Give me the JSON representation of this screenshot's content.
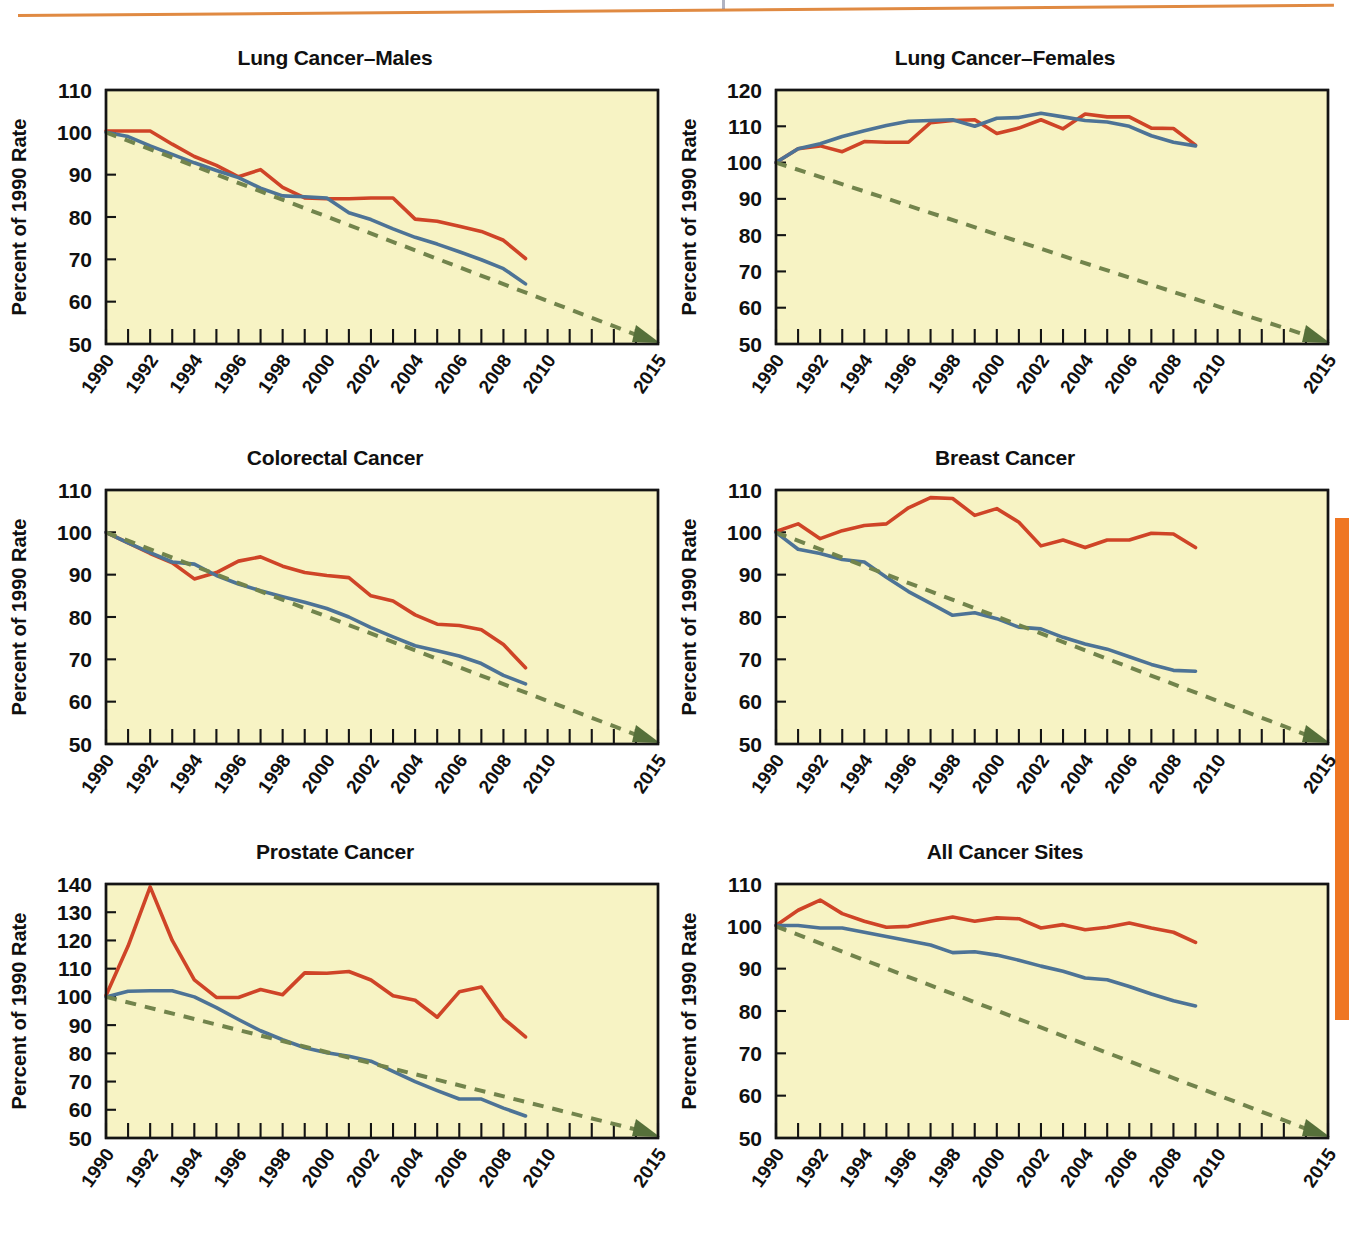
{
  "page": {
    "accent_orange": "#ef7622",
    "rule_color": "#e08a42",
    "plot_background": "#f7f3c4",
    "series_colors": {
      "observed_red": "#cf4427",
      "observed_blue": "#4d7396",
      "target_green": "#72844c"
    }
  },
  "axis_common": {
    "xlabel": "Year",
    "ylabel": "Percent of 1990 Rate",
    "xtick_labels": [
      "1990",
      "1992",
      "1994",
      "1996",
      "1998",
      "2000",
      "2002",
      "2004",
      "2006",
      "2008",
      "2010",
      "2015"
    ],
    "xtick_values": [
      1990,
      1992,
      1994,
      1996,
      1998,
      2000,
      2002,
      2004,
      2006,
      2008,
      2010,
      2015
    ],
    "xlim": [
      1990,
      2015
    ],
    "minor_tick_step": 1
  },
  "chart_data": [
    {
      "type": "line",
      "title": "Lung Cancer–Males",
      "xlabel": "Year",
      "ylabel": "Percent of 1990 Rate",
      "ylim": [
        50,
        110
      ],
      "ytick_labels": [
        "50",
        "60",
        "70",
        "80",
        "90",
        "100",
        "110"
      ],
      "ytick_values": [
        50,
        60,
        70,
        80,
        90,
        100,
        110
      ],
      "grid": false,
      "legend": "none",
      "x": [
        1990,
        1991,
        1992,
        1993,
        1994,
        1995,
        1996,
        1997,
        1998,
        1999,
        2000,
        2001,
        2002,
        2003,
        2004,
        2005,
        2006,
        2007,
        2008,
        2009
      ],
      "series": [
        {
          "name": "Observed (red)",
          "color": "#cf4427",
          "values": [
            100.3,
            100.3,
            100.3,
            97.2,
            94.3,
            92.2,
            89.5,
            91.2,
            87.0,
            84.5,
            84.3,
            84.3,
            84.5,
            84.5,
            79.5,
            79.0,
            77.8,
            76.6,
            74.5,
            70.2
          ]
        },
        {
          "name": "Observed (blue)",
          "color": "#4d7396",
          "values": [
            100.0,
            99.0,
            96.8,
            94.8,
            92.8,
            91.0,
            89.3,
            86.8,
            85.0,
            84.8,
            84.5,
            81.0,
            79.4,
            77.2,
            75.2,
            73.6,
            71.8,
            69.9,
            67.8,
            64.2
          ]
        },
        {
          "name": "Healthy People 2020 target (green dashed)",
          "color": "#72844c",
          "dashed": true,
          "values": [
            100.0,
            50.0
          ],
          "endpoints_x": [
            1990,
            2015
          ],
          "arrow_end": true
        }
      ]
    },
    {
      "type": "line",
      "title": "Lung Cancer–Females",
      "xlabel": "Year",
      "ylabel": "Percent of 1990 Rate",
      "ylim": [
        50,
        120
      ],
      "ytick_labels": [
        "50",
        "60",
        "70",
        "80",
        "90",
        "100",
        "110",
        "120"
      ],
      "ytick_values": [
        50,
        60,
        70,
        80,
        90,
        100,
        110,
        120
      ],
      "grid": false,
      "legend": "none",
      "x": [
        1990,
        1991,
        1992,
        1993,
        1994,
        1995,
        1996,
        1997,
        1998,
        1999,
        2000,
        2001,
        2002,
        2003,
        2004,
        2005,
        2006,
        2007,
        2008,
        2009
      ],
      "series": [
        {
          "name": "Observed (red)",
          "color": "#cf4427",
          "values": [
            100.0,
            103.8,
            104.6,
            103.0,
            105.8,
            105.6,
            105.6,
            111.0,
            111.6,
            111.8,
            108.0,
            109.5,
            111.8,
            109.3,
            113.4,
            112.6,
            112.6,
            109.5,
            109.4,
            104.8
          ]
        },
        {
          "name": "Observed (blue)",
          "color": "#4d7396",
          "values": [
            100.0,
            103.8,
            105.2,
            107.2,
            108.8,
            110.2,
            111.4,
            111.6,
            111.8,
            110.0,
            112.2,
            112.4,
            113.6,
            112.6,
            111.6,
            111.2,
            110.0,
            107.4,
            105.6,
            104.6
          ]
        },
        {
          "name": "Healthy People 2020 target (green dashed)",
          "color": "#72844c",
          "dashed": true,
          "values": [
            100.0,
            50.0
          ],
          "endpoints_x": [
            1990,
            2015
          ],
          "arrow_end": true
        }
      ]
    },
    {
      "type": "line",
      "title": "Colorectal Cancer",
      "xlabel": "Year",
      "ylabel": "Percent of 1990 Rate",
      "ylim": [
        50,
        110
      ],
      "ytick_labels": [
        "50",
        "60",
        "70",
        "80",
        "90",
        "100",
        "110"
      ],
      "ytick_values": [
        50,
        60,
        70,
        80,
        90,
        100,
        110
      ],
      "grid": false,
      "legend": "none",
      "x": [
        1990,
        1991,
        1992,
        1993,
        1994,
        1995,
        1996,
        1997,
        1998,
        1999,
        2000,
        2001,
        2002,
        2003,
        2004,
        2005,
        2006,
        2007,
        2008,
        2009
      ],
      "values_note": "",
      "series": [
        {
          "name": "Observed (red)",
          "color": "#cf4427",
          "values": [
            100.0,
            97.5,
            95.0,
            92.8,
            89.0,
            90.5,
            93.2,
            94.2,
            92.0,
            90.5,
            89.8,
            89.3,
            85.0,
            83.8,
            80.5,
            78.3,
            78.0,
            77.0,
            73.5,
            68.0
          ]
        },
        {
          "name": "Observed (blue)",
          "color": "#4d7396",
          "values": [
            100.0,
            97.5,
            95.2,
            93.0,
            92.5,
            89.8,
            87.8,
            86.2,
            84.8,
            83.5,
            82.0,
            80.0,
            77.5,
            75.3,
            73.2,
            72.0,
            70.8,
            69.0,
            66.2,
            64.2
          ]
        },
        {
          "name": "Healthy People 2020 target (green dashed)",
          "color": "#72844c",
          "dashed": true,
          "values": [
            100.0,
            50.0
          ],
          "endpoints_x": [
            1990,
            2015
          ],
          "arrow_end": true
        }
      ]
    },
    {
      "type": "line",
      "title": "Breast Cancer",
      "xlabel": "Year",
      "ylabel": "Percent of 1990 Rate",
      "ylim": [
        50,
        110
      ],
      "ytick_labels": [
        "50",
        "60",
        "70",
        "80",
        "90",
        "100",
        "110"
      ],
      "ytick_values": [
        50,
        60,
        70,
        80,
        90,
        100,
        110
      ],
      "grid": false,
      "legend": "none",
      "x": [
        1990,
        1991,
        1992,
        1993,
        1994,
        1995,
        1996,
        1997,
        1998,
        1999,
        2000,
        2001,
        2002,
        2003,
        2004,
        2005,
        2006,
        2007,
        2008,
        2009
      ],
      "series": [
        {
          "name": "Observed (red)",
          "color": "#cf4427",
          "values": [
            100.2,
            102.0,
            98.5,
            100.4,
            101.6,
            102.0,
            105.8,
            108.2,
            108.0,
            104.0,
            105.6,
            102.4,
            96.8,
            98.2,
            96.4,
            98.2,
            98.2,
            99.8,
            99.6,
            96.4
          ]
        },
        {
          "name": "Observed (blue)",
          "color": "#4d7396",
          "values": [
            100.0,
            96.0,
            95.0,
            93.6,
            93.0,
            89.4,
            86.0,
            83.2,
            80.4,
            81.0,
            79.6,
            77.6,
            77.2,
            75.2,
            73.6,
            72.4,
            70.6,
            68.8,
            67.4,
            67.2
          ]
        },
        {
          "name": "Healthy People 2020 target (green dashed)",
          "color": "#72844c",
          "dashed": true,
          "values": [
            100.0,
            50.0
          ],
          "endpoints_x": [
            1990,
            2015
          ],
          "arrow_end": true
        }
      ]
    },
    {
      "type": "line",
      "title": "Prostate Cancer",
      "xlabel": "Year",
      "ylabel": "Percent of 1990 Rate",
      "ylim": [
        50,
        140
      ],
      "ytick_labels": [
        "50",
        "60",
        "70",
        "80",
        "90",
        "100",
        "110",
        "120",
        "130",
        "140"
      ],
      "ytick_values": [
        50,
        60,
        70,
        80,
        90,
        100,
        110,
        120,
        130,
        140
      ],
      "grid": false,
      "legend": "none",
      "x": [
        1990,
        1991,
        1992,
        1993,
        1994,
        1995,
        1996,
        1997,
        1998,
        1999,
        2000,
        2001,
        2002,
        2003,
        2004,
        2005,
        2006,
        2007,
        2008,
        2009
      ],
      "series": [
        {
          "name": "Observed (red)",
          "color": "#cf4427",
          "values": [
            100.5,
            118.0,
            139.0,
            120.0,
            106.0,
            99.8,
            99.8,
            102.6,
            100.8,
            108.5,
            108.4,
            109.0,
            106.0,
            100.4,
            98.8,
            92.8,
            101.8,
            103.5,
            92.4,
            85.8
          ]
        },
        {
          "name": "Observed (blue)",
          "color": "#4d7396",
          "values": [
            100.0,
            102.0,
            102.2,
            102.2,
            100.0,
            96.2,
            92.0,
            88.0,
            84.8,
            82.0,
            80.2,
            79.0,
            77.2,
            73.6,
            70.0,
            66.8,
            63.8,
            63.8,
            60.6,
            57.8
          ]
        },
        {
          "name": "Healthy People 2020 target (green dashed)",
          "color": "#72844c",
          "dashed": true,
          "values": [
            100.0,
            50.0
          ],
          "endpoints_x": [
            1990,
            2015
          ],
          "arrow_end": true
        }
      ]
    },
    {
      "type": "line",
      "title": "All Cancer Sites",
      "xlabel": "Year",
      "ylabel": "Percent of 1990 Rate",
      "ylim": [
        50,
        110
      ],
      "ytick_labels": [
        "50",
        "60",
        "70",
        "80",
        "90",
        "100",
        "110"
      ],
      "ytick_values": [
        50,
        60,
        70,
        80,
        90,
        100,
        110
      ],
      "grid": false,
      "legend": "none",
      "x": [
        1990,
        1991,
        1992,
        1993,
        1994,
        1995,
        1996,
        1997,
        1998,
        1999,
        2000,
        2001,
        2002,
        2003,
        2004,
        2005,
        2006,
        2007,
        2008,
        2009
      ],
      "series": [
        {
          "name": "Observed (red)",
          "color": "#cf4427",
          "values": [
            100.2,
            103.8,
            106.2,
            103.0,
            101.2,
            99.8,
            100.0,
            101.2,
            102.2,
            101.2,
            102.0,
            101.8,
            99.6,
            100.4,
            99.2,
            99.8,
            100.8,
            99.6,
            98.6,
            96.2
          ]
        },
        {
          "name": "Observed (blue)",
          "color": "#4d7396",
          "values": [
            100.2,
            100.2,
            99.6,
            99.6,
            98.6,
            97.6,
            96.6,
            95.6,
            93.8,
            94.0,
            93.2,
            92.0,
            90.6,
            89.4,
            87.8,
            87.4,
            85.8,
            84.0,
            82.4,
            81.2
          ]
        },
        {
          "name": "Healthy People 2020 target (green dashed)",
          "color": "#72844c",
          "dashed": true,
          "values": [
            100.0,
            50.0
          ],
          "endpoints_x": [
            1990,
            2015
          ],
          "arrow_end": true
        }
      ]
    }
  ]
}
